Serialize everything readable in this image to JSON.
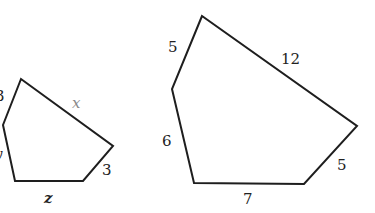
{
  "figure": {
    "colors": {
      "stroke": "#1e1e1e",
      "label": "#222222",
      "muted_label": "#8a8a8a",
      "background": "#ffffff"
    },
    "small_pentagon": {
      "vertices": [
        [
          21,
          79
        ],
        [
          3,
          125
        ],
        [
          15,
          181
        ],
        [
          83,
          181
        ],
        [
          113,
          146
        ]
      ],
      "labels": {
        "top_left_side": "3",
        "left_lower_side": "y",
        "bottom_side": "z",
        "bottom_right_side": "3",
        "top_right_side": "x"
      }
    },
    "large_pentagon": {
      "vertices": [
        [
          202,
          16
        ],
        [
          172,
          89
        ],
        [
          194,
          183
        ],
        [
          304,
          184
        ],
        [
          357,
          126
        ]
      ],
      "labels": {
        "top_left_side": "5",
        "left_lower_side": "6",
        "bottom_side": "7",
        "bottom_right_side": "5",
        "top_right_side": "12"
      }
    }
  }
}
